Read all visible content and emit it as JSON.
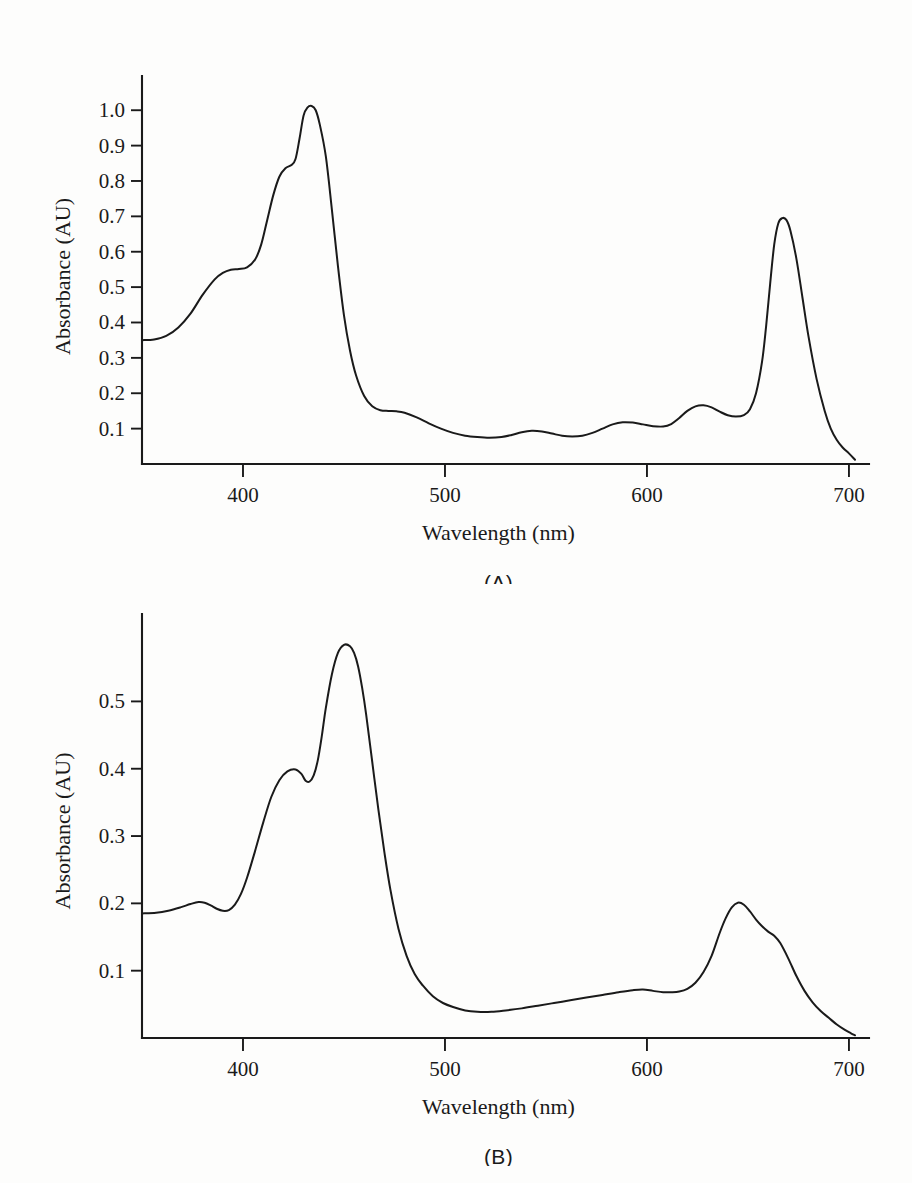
{
  "figure": {
    "background_color": "#fdfdfc",
    "line_color": "#1a1a1a",
    "panel_a_caption": "(A)",
    "panel_b_caption": "(B)"
  },
  "chart_data": [
    {
      "id": "panel-a",
      "type": "line",
      "title": "",
      "caption": "(A)",
      "xlabel": "Wavelength (nm)",
      "ylabel": "Absorbance (AU)",
      "xlim": [
        350,
        703
      ],
      "ylim": [
        0,
        1.06
      ],
      "xticks": [
        400,
        500,
        600,
        700
      ],
      "xtick_labels": [
        "400",
        "500",
        "600",
        "700"
      ],
      "yticks": [
        0.1,
        0.2,
        0.3,
        0.4,
        0.5,
        0.6,
        0.7,
        0.8,
        0.9,
        1.0
      ],
      "ytick_labels": [
        "0.1",
        "0.2",
        "0.3",
        "0.4",
        "0.5",
        "0.6",
        "0.7",
        "0.8",
        "0.9",
        "1.0"
      ],
      "grid": false,
      "legend": "none",
      "series": [
        {
          "name": "Absorption spectrum A",
          "x": [
            350,
            356,
            362,
            368,
            374,
            380,
            386,
            390,
            394,
            398,
            402,
            406,
            409,
            412,
            415,
            418,
            421,
            424,
            426,
            428,
            430,
            432,
            434,
            436,
            438,
            441,
            444,
            447,
            450,
            453,
            456,
            460,
            464,
            468,
            472,
            476,
            480,
            486,
            492,
            498,
            504,
            510,
            516,
            522,
            528,
            533,
            538,
            543,
            548,
            553,
            558,
            563,
            568,
            573,
            578,
            583,
            588,
            593,
            598,
            603,
            608,
            612,
            616,
            620,
            624,
            628,
            632,
            636,
            640,
            644,
            648,
            651,
            654,
            657,
            659,
            661,
            663,
            665,
            667,
            669,
            671,
            674,
            677,
            680,
            684,
            688,
            691,
            694,
            697,
            700,
            703
          ],
          "y": [
            0.35,
            0.352,
            0.362,
            0.386,
            0.425,
            0.478,
            0.522,
            0.54,
            0.549,
            0.551,
            0.556,
            0.578,
            0.62,
            0.69,
            0.76,
            0.812,
            0.836,
            0.845,
            0.862,
            0.92,
            0.985,
            1.008,
            1.012,
            1.0,
            0.96,
            0.87,
            0.72,
            0.56,
            0.42,
            0.32,
            0.25,
            0.192,
            0.163,
            0.152,
            0.15,
            0.149,
            0.145,
            0.132,
            0.115,
            0.1,
            0.088,
            0.08,
            0.076,
            0.074,
            0.076,
            0.082,
            0.09,
            0.094,
            0.092,
            0.086,
            0.08,
            0.078,
            0.08,
            0.088,
            0.1,
            0.112,
            0.118,
            0.117,
            0.112,
            0.107,
            0.106,
            0.113,
            0.13,
            0.15,
            0.163,
            0.166,
            0.16,
            0.148,
            0.138,
            0.134,
            0.138,
            0.155,
            0.2,
            0.29,
            0.39,
            0.51,
            0.62,
            0.68,
            0.695,
            0.69,
            0.66,
            0.58,
            0.47,
            0.36,
            0.24,
            0.15,
            0.1,
            0.068,
            0.046,
            0.03,
            0.012
          ]
        }
      ],
      "annotations": {
        "soret_peak_nm": 430,
        "soret_peak_absorbance": 1.01,
        "soret_shoulder_nm": 412,
        "soret_shoulder_absorbance": 0.84,
        "uv_shoulder_nm": 382,
        "uv_shoulder_absorbance": 0.55,
        "qy_peak_nm": 662,
        "qy_peak_absorbance": 0.7,
        "qx_peak_nm": 616,
        "qx_peak_absorbance": 0.165,
        "start_absorbance": 0.35
      }
    },
    {
      "id": "panel-b",
      "type": "line",
      "title": "",
      "caption": "(B)",
      "xlabel": "Wavelength (nm)",
      "ylabel": "Absorbance (AU)",
      "xlim": [
        350,
        703
      ],
      "ylim": [
        0,
        0.615
      ],
      "xticks": [
        400,
        500,
        600,
        700
      ],
      "xtick_labels": [
        "400",
        "500",
        "600",
        "700"
      ],
      "yticks": [
        0.1,
        0.2,
        0.3,
        0.4,
        0.5
      ],
      "ytick_labels": [
        "0.1",
        "0.2",
        "0.3",
        "0.4",
        "0.5"
      ],
      "grid": false,
      "legend": "none",
      "series": [
        {
          "name": "Absorption spectrum B",
          "x": [
            350,
            357,
            363,
            369,
            374,
            378,
            381,
            384,
            387,
            390,
            393,
            396,
            399,
            402,
            406,
            410,
            414,
            418,
            422,
            426,
            429,
            431,
            433,
            435,
            437,
            439,
            441,
            444,
            447,
            450,
            453,
            455,
            457,
            459,
            461,
            464,
            467,
            470,
            473,
            477,
            481,
            485,
            489,
            494,
            499,
            504,
            510,
            516,
            523,
            530,
            538,
            546,
            554,
            562,
            570,
            578,
            586,
            593,
            598,
            603,
            608,
            612,
            616,
            620,
            624,
            628,
            632,
            636,
            639,
            642,
            645,
            648,
            651,
            654,
            657,
            660,
            663,
            666,
            670,
            674,
            678,
            682,
            686,
            690,
            694,
            698,
            701,
            703
          ],
          "y": [
            0.185,
            0.186,
            0.189,
            0.194,
            0.199,
            0.202,
            0.201,
            0.197,
            0.192,
            0.189,
            0.19,
            0.198,
            0.214,
            0.238,
            0.278,
            0.32,
            0.358,
            0.383,
            0.396,
            0.399,
            0.392,
            0.382,
            0.381,
            0.39,
            0.412,
            0.448,
            0.49,
            0.54,
            0.572,
            0.584,
            0.582,
            0.572,
            0.552,
            0.52,
            0.48,
            0.41,
            0.34,
            0.276,
            0.22,
            0.162,
            0.122,
            0.095,
            0.078,
            0.062,
            0.052,
            0.046,
            0.041,
            0.039,
            0.039,
            0.041,
            0.044,
            0.048,
            0.052,
            0.056,
            0.06,
            0.064,
            0.068,
            0.071,
            0.072,
            0.07,
            0.068,
            0.068,
            0.069,
            0.073,
            0.082,
            0.098,
            0.122,
            0.156,
            0.178,
            0.194,
            0.201,
            0.198,
            0.188,
            0.176,
            0.166,
            0.158,
            0.152,
            0.141,
            0.118,
            0.092,
            0.07,
            0.053,
            0.04,
            0.03,
            0.02,
            0.012,
            0.007,
            0.004
          ]
        }
      ],
      "annotations": {
        "soret_peak_nm": 455,
        "soret_peak_absorbance": 0.585,
        "soret_shoulder_nm": 428,
        "soret_shoulder_absorbance": 0.4,
        "uv_shoulder_nm": 379,
        "uv_shoulder_absorbance": 0.202,
        "qy_peak_nm": 645,
        "qy_peak_absorbance": 0.201,
        "qy_shoulder_nm": 660,
        "qy_shoulder_absorbance": 0.158,
        "qx_peak_nm": 599,
        "qx_peak_absorbance": 0.072,
        "start_absorbance": 0.185
      }
    }
  ]
}
